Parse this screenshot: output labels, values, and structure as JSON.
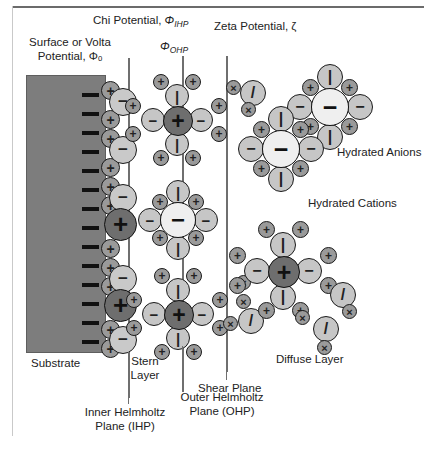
{
  "figure": {
    "domain": "electrical double layer diagram",
    "background_color": "#ffffff",
    "frame_color": "#6b6b6b"
  },
  "labels": {
    "surface_potential": "Surface or Volta\nPotential, Φₒ",
    "surface_potential_line1": "Surface or Volta",
    "surface_potential_line2": "Potential, Φₒ",
    "chi_potential": "Chi Potential, ΦIHP",
    "chi_potential_prefix": "Chi Potential, ",
    "chi_potential_symbol": "Φ",
    "chi_potential_sub": "IHP",
    "phi_ohp_symbol": "Φ",
    "phi_ohp_sub": "OHP",
    "zeta_potential": "Zeta Potential, ζ",
    "substrate": "Substrate",
    "stern_layer_line1": "Stern",
    "stern_layer_line2": "Layer",
    "shear_plane": "Shear Plane",
    "diffuse_layer": "Diffuse Layer",
    "hydrated_anions": "Hydrated Anions",
    "hydrated_cations": "Hydrated Cations",
    "inner_helmholtz_line1": "Inner Helmholtz",
    "inner_helmholtz_line2": "Plane (IHP)",
    "outer_helmholtz_line1": "Outer Helmholtz",
    "outer_helmholtz_line2": "Plane (OHP)"
  },
  "glyphs": {
    "plus": "+",
    "minus": "−",
    "cross": "×",
    "dipole_bar": "|",
    "dipole_slash": "/"
  },
  "colors": {
    "substrate_fill": "#7d7d7d",
    "substrate_stroke": "#5e5e5e",
    "water_fill": "#c6c6c6",
    "small_ion_fill": "#9a9a9a",
    "core_cation_fill": "#6e6e6e",
    "core_anion_fill": "#efefef",
    "outline": "#1b1b1b",
    "plane_line": "#6f6f6f"
  },
  "planes": [
    {
      "name": "inner-helmholtz-plane",
      "x": 128,
      "y_top": 58,
      "y_bottom": 398
    },
    {
      "name": "outer-helmholtz-plane",
      "x": 182,
      "y_top": 56,
      "y_bottom": 392
    },
    {
      "name": "shear-plane",
      "x": 226,
      "y_top": 56,
      "y_bottom": 372
    }
  ],
  "surface_charge_marks": 14,
  "stern_column": {
    "description": "alternating small cations and large hydrated anions pinned to substrate face",
    "small_cation_count": 11,
    "large_anion_count": 5,
    "large_cation_count": 2
  }
}
